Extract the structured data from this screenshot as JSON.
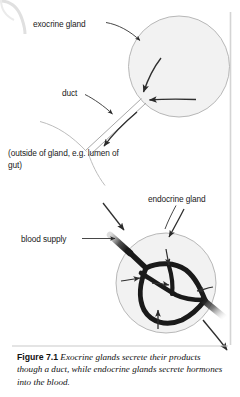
{
  "figure": {
    "labels": {
      "exocrine_gland": "exocrine gland",
      "duct": "duct",
      "outside_of_gland": "(outside of gland, e.g. lumen of gut)",
      "endocrine_gland": "endocrine gland",
      "blood_supply": "blood supply"
    },
    "caption": {
      "number": "Figure 7.1",
      "text": "Exocrine glands secrete their products though a duct, while endocrine glands secrete hormones into the blood."
    },
    "colors": {
      "page_background": "#ffffff",
      "gland_fill": "#f2f2f2",
      "gland_stroke": "#b3b3b3",
      "vessel": "#1a1a1a",
      "arrow": "#333333",
      "duct_line": "#a6a6a6",
      "text": "#111111",
      "rule": "#cccccc",
      "page_edge": "#d9d9d9"
    },
    "elements": {
      "exocrine_circle": "exocrine-gland-circle",
      "endocrine_circle": "endocrine-gland-circle",
      "duct_tube": "duct-tube",
      "lumen_wall": "lumen-wall",
      "blood_vessel_network": "blood-vessel-network",
      "secretion_arrows": "secretion-arrows",
      "hormone_exit_arrow": "hormone-exit-arrow",
      "blood_inflow_arrow": "blood-inflow-arrow",
      "caption_rule": "caption-rule",
      "page_edge_right": "page-edge-right-line"
    }
  }
}
